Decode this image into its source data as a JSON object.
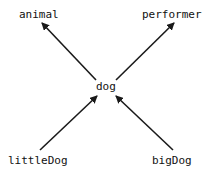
{
  "diagram": {
    "type": "class-hierarchy",
    "nodes": {
      "animal": "animal",
      "performer": "performer",
      "dog": "dog",
      "littleDog": "littleDog",
      "bigDog": "bigDog"
    },
    "edges": [
      {
        "from": "dog",
        "to": "animal"
      },
      {
        "from": "dog",
        "to": "performer"
      },
      {
        "from": "littleDog",
        "to": "dog"
      },
      {
        "from": "bigDog",
        "to": "dog"
      }
    ],
    "colors": {
      "line": "#1a1a1a",
      "text": "#111111",
      "background": "#ffffff"
    }
  }
}
